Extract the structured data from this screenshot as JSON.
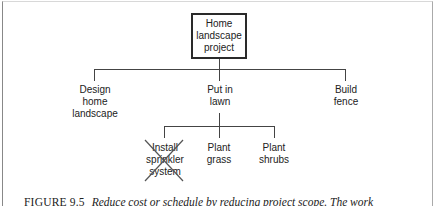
{
  "diagram": {
    "type": "work-breakdown-structure",
    "root": {
      "label": "Home\nlandscape\nproject"
    },
    "level1": [
      {
        "label": "Design\nhome\nlandscape"
      },
      {
        "label": "Put in\nlawn"
      },
      {
        "label": "Build\nfence"
      }
    ],
    "level2": [
      {
        "label": "Install\nsprinkler\nsystem",
        "crossed_out": true
      },
      {
        "label": "Plant\ngrass",
        "crossed_out": false
      },
      {
        "label": "Plant\nshrubs",
        "crossed_out": false
      }
    ],
    "colors": {
      "lines": "#444444",
      "text": "#222222",
      "cross": "#555555"
    }
  },
  "caption": {
    "label": "FIGURE 9.5",
    "text": "Reduce cost or schedule by reducing project scope. The work"
  }
}
